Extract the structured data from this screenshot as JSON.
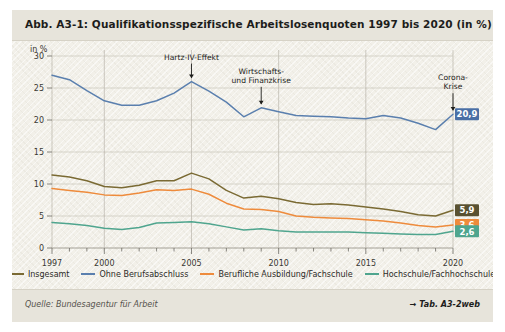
{
  "figure": {
    "title": "Abb. A3-1: Qualifikationsspezifische Arbeitslosenquoten 1997 bis 2020 (in %)",
    "source": "Quelle: Bundesagentur für Arbeit",
    "reference": "→ Tab. A3-2web",
    "unit_label": "in %"
  },
  "legend": [
    {
      "label": "Insgesamt",
      "color": "#7a6a33"
    },
    {
      "label": "Ohne Berufsabschluss",
      "color": "#5a7fae"
    },
    {
      "label": "Berufliche Ausbildung/Fachschule",
      "color": "#ee8b3c"
    },
    {
      "label": "Hochschule/Fachhochschule",
      "color": "#4fa58e"
    }
  ],
  "annotations": [
    {
      "text": "Hartz-IV-Effekt",
      "year": 2005,
      "value": 26.0
    },
    {
      "text": "Wirtschafts-",
      "text2": "und Finanzkrise",
      "year": 2009,
      "value": 21.9
    },
    {
      "text": "Corona-",
      "text2": "Krise",
      "year": 2020,
      "value": 20.9
    }
  ],
  "end_labels": [
    {
      "value": "20,9",
      "color": "#4a6fa5",
      "series": "Ohne Berufsabschluss"
    },
    {
      "value": "5,9",
      "color": "#595131",
      "series": "Insgesamt"
    },
    {
      "value": "3,6",
      "color": "#ee8b3c",
      "series": "Berufliche Ausbildung/Fachschule"
    },
    {
      "value": "2,6",
      "color": "#4fa58e",
      "series": "Hochschule/Fachhochschule"
    }
  ],
  "chart_data": {
    "type": "line",
    "title": "Abb. A3-1: Qualifikationsspezifische Arbeitslosenquoten 1997 bis 2020 (in %)",
    "xlabel": "",
    "ylabel": "in %",
    "ylim": [
      0,
      30
    ],
    "yticks": [
      0,
      5,
      10,
      15,
      20,
      25,
      30
    ],
    "xlim": [
      1997,
      2020
    ],
    "xticks": [
      1997,
      2000,
      2005,
      2010,
      2015,
      2020
    ],
    "xticklabels": [
      "1997",
      "2000",
      "2005",
      "2010",
      "2015",
      "2020"
    ],
    "grid": true,
    "legend_position": "bottom",
    "x": [
      1997,
      1998,
      1999,
      2000,
      2001,
      2002,
      2003,
      2004,
      2005,
      2006,
      2007,
      2008,
      2009,
      2010,
      2011,
      2012,
      2013,
      2014,
      2015,
      2016,
      2017,
      2018,
      2019,
      2020
    ],
    "series": [
      {
        "name": "Ohne Berufsabschluss",
        "color": "#5a7fae",
        "values": [
          27.0,
          26.3,
          24.6,
          23.0,
          22.3,
          22.3,
          23.0,
          24.2,
          26.0,
          24.5,
          22.8,
          20.5,
          21.9,
          21.3,
          20.7,
          20.6,
          20.5,
          20.3,
          20.2,
          20.7,
          20.3,
          19.5,
          18.5,
          20.9
        ]
      },
      {
        "name": "Insgesamt",
        "color": "#7a6a33",
        "values": [
          11.4,
          11.1,
          10.5,
          9.6,
          9.4,
          9.8,
          10.5,
          10.5,
          11.7,
          10.8,
          9.0,
          7.8,
          8.1,
          7.7,
          7.1,
          6.8,
          6.9,
          6.7,
          6.4,
          6.1,
          5.7,
          5.2,
          5.0,
          5.9
        ]
      },
      {
        "name": "Berufliche Ausbildung/Fachschule",
        "color": "#ee8b3c",
        "values": [
          9.3,
          9.0,
          8.7,
          8.3,
          8.2,
          8.6,
          9.1,
          9.0,
          9.2,
          8.4,
          7.0,
          6.1,
          6.0,
          5.7,
          5.0,
          4.8,
          4.7,
          4.6,
          4.4,
          4.2,
          3.9,
          3.5,
          3.3,
          3.6
        ]
      },
      {
        "name": "Hochschule/Fachhochschule",
        "color": "#4fa58e",
        "values": [
          4.0,
          3.8,
          3.5,
          3.1,
          2.9,
          3.2,
          3.9,
          4.0,
          4.1,
          3.8,
          3.3,
          2.8,
          3.0,
          2.7,
          2.5,
          2.5,
          2.5,
          2.5,
          2.4,
          2.3,
          2.2,
          2.1,
          2.1,
          2.6
        ]
      }
    ]
  }
}
